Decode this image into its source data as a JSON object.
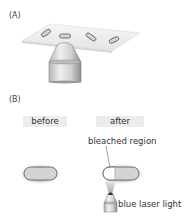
{
  "panel_a": {
    "label": "(A)",
    "description": "Slide with four elongated cells above an objective lens",
    "cell_count": 4
  },
  "panel_b": {
    "label": "(B)",
    "before_label": "before",
    "after_label": "after",
    "bleached_region_label": "bleached region",
    "laser_label": "blue laser light"
  },
  "colors": {
    "slide": "#f2f2f2",
    "cell_fill": "#d4d4d4",
    "cell_stroke": "#555555",
    "glow": "#c8c8c8",
    "bleached_fill": "#ffffff",
    "tag_bg": "#ececec",
    "objective_light": "#e6e6e6",
    "objective_dark": "#9a9a9a"
  }
}
